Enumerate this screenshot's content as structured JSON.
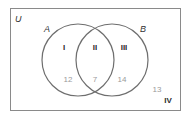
{
  "diagram": {
    "type": "venn",
    "universe_label": "U",
    "sets": [
      {
        "name": "A",
        "label": "A"
      },
      {
        "name": "B",
        "label": "B"
      }
    ],
    "regions": [
      {
        "id": "I",
        "label": "I",
        "description": "A only",
        "value": "12"
      },
      {
        "id": "II",
        "label": "II",
        "description": "A and B",
        "value": "7"
      },
      {
        "id": "III",
        "label": "III",
        "description": "B only",
        "value": "14"
      },
      {
        "id": "IV",
        "label": "IV",
        "description": "neither A nor B",
        "value": "13"
      }
    ],
    "colors": {
      "border": "#8a8a8a",
      "circle": "#6e6e6e",
      "region_label": "#2b2b2b",
      "value": "#9a9a9a",
      "set_label": "#333333"
    }
  }
}
